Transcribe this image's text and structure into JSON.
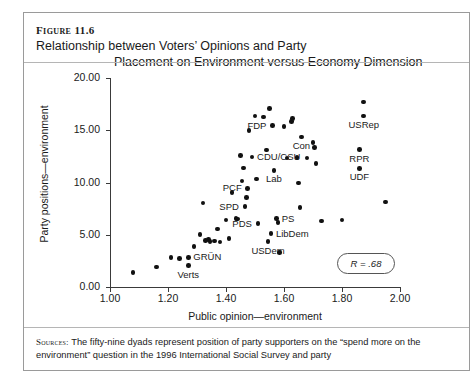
{
  "figure": {
    "number_label": "Figure 11.6",
    "title_line1": "Relationship between Voters’ Opinions and Party",
    "title_line2": "Placement on Environment versus Economy Dimension"
  },
  "source_note": {
    "keyword": "Sources:",
    "text": " The fifty-nine dyads represent position of party supporters on the “spend more on the environment” question in the 1996 International Social Survey and party"
  },
  "annotation": {
    "r_value": "R = .68"
  },
  "chart_data": {
    "type": "scatter",
    "title": "Relationship between Voters’ Opinions and Party Placement on Environment versus Economy Dimension",
    "xlabel": "Public opinion—environment",
    "ylabel": "Party positions—environment",
    "xlim": [
      1.0,
      2.0
    ],
    "ylim": [
      0.0,
      20.0
    ],
    "xticks": [
      "1.00",
      "1.20",
      "1.40",
      "1.60",
      "1.80",
      "2.00"
    ],
    "xtick_values": [
      1.0,
      1.2,
      1.4,
      1.6,
      1.8,
      2.0
    ],
    "yticks": [
      "0.00",
      "5.00",
      "10.00",
      "15.00",
      "20.00"
    ],
    "ytick_values": [
      0.0,
      5.0,
      10.0,
      15.0,
      20.0
    ],
    "grid": false,
    "legend": false,
    "correlation": 0.68,
    "n_points": 59,
    "marker_color": "#111111",
    "points": [
      {
        "x": 1.08,
        "y": 1.4
      },
      {
        "x": 1.16,
        "y": 1.9
      },
      {
        "x": 1.21,
        "y": 2.8
      },
      {
        "x": 1.24,
        "y": 2.75
      },
      {
        "x": 1.27,
        "y": 2.05,
        "label": "Verts",
        "label_pos": "below"
      },
      {
        "x": 1.27,
        "y": 2.85,
        "label": "GRÜN",
        "label_pos": "right"
      },
      {
        "x": 1.29,
        "y": 3.9
      },
      {
        "x": 1.31,
        "y": 5.0
      },
      {
        "x": 1.33,
        "y": 4.45
      },
      {
        "x": 1.34,
        "y": 4.55
      },
      {
        "x": 1.345,
        "y": 4.35
      },
      {
        "x": 1.36,
        "y": 4.4
      },
      {
        "x": 1.37,
        "y": 5.55
      },
      {
        "x": 1.32,
        "y": 8.05
      },
      {
        "x": 1.38,
        "y": 4.3
      },
      {
        "x": 1.4,
        "y": 6.4
      },
      {
        "x": 1.41,
        "y": 4.65
      },
      {
        "x": 1.42,
        "y": 9.05
      },
      {
        "x": 1.435,
        "y": 6.55
      },
      {
        "x": 1.44,
        "y": 6.5
      },
      {
        "x": 1.45,
        "y": 12.6
      },
      {
        "x": 1.455,
        "y": 10.15
      },
      {
        "x": 1.46,
        "y": 11.4
      },
      {
        "x": 1.465,
        "y": 7.7,
        "label": "SPD",
        "label_pos": "left"
      },
      {
        "x": 1.47,
        "y": 8.55
      },
      {
        "x": 1.475,
        "y": 9.45,
        "label": "PCF",
        "label_pos": "left"
      },
      {
        "x": 1.48,
        "y": 14.95
      },
      {
        "x": 1.49,
        "y": 12.45,
        "label": "CDU/CSU",
        "label_pos": "right"
      },
      {
        "x": 1.5,
        "y": 16.35
      },
      {
        "x": 1.505,
        "y": 10.35
      },
      {
        "x": 1.51,
        "y": 6.05,
        "label": "PDS",
        "label_pos": "left"
      },
      {
        "x": 1.53,
        "y": 16.25
      },
      {
        "x": 1.54,
        "y": 13.1
      },
      {
        "x": 1.545,
        "y": 4.35,
        "label": "USDem",
        "label_pos": "below"
      },
      {
        "x": 1.55,
        "y": 17.1
      },
      {
        "x": 1.555,
        "y": 5.1,
        "label": "LibDem",
        "label_pos": "right"
      },
      {
        "x": 1.56,
        "y": 15.45,
        "label": "FDP",
        "label_pos": "left"
      },
      {
        "x": 1.565,
        "y": 11.15,
        "label": "Lab",
        "label_pos": "below"
      },
      {
        "x": 1.575,
        "y": 6.55,
        "label": "PS",
        "label_pos": "right"
      },
      {
        "x": 1.58,
        "y": 6.15
      },
      {
        "x": 1.585,
        "y": 3.3
      },
      {
        "x": 1.6,
        "y": 15.35
      },
      {
        "x": 1.61,
        "y": 12.35
      },
      {
        "x": 1.625,
        "y": 15.85
      },
      {
        "x": 1.63,
        "y": 16.1
      },
      {
        "x": 1.645,
        "y": 12.4
      },
      {
        "x": 1.65,
        "y": 9.95
      },
      {
        "x": 1.655,
        "y": 7.6
      },
      {
        "x": 1.66,
        "y": 14.35,
        "label": "Con",
        "label_pos": "below"
      },
      {
        "x": 1.68,
        "y": 12.35
      },
      {
        "x": 1.7,
        "y": 13.8
      },
      {
        "x": 1.705,
        "y": 13.35
      },
      {
        "x": 1.71,
        "y": 11.8
      },
      {
        "x": 1.73,
        "y": 6.3
      },
      {
        "x": 1.8,
        "y": 6.4
      },
      {
        "x": 1.875,
        "y": 17.7
      },
      {
        "x": 1.875,
        "y": 16.35,
        "label": "USRep",
        "label_pos": "below"
      },
      {
        "x": 1.86,
        "y": 13.15,
        "label": "RPR",
        "label_pos": "below"
      },
      {
        "x": 1.86,
        "y": 11.35,
        "label": "UDF",
        "label_pos": "below"
      },
      {
        "x": 1.95,
        "y": 8.15
      }
    ]
  }
}
